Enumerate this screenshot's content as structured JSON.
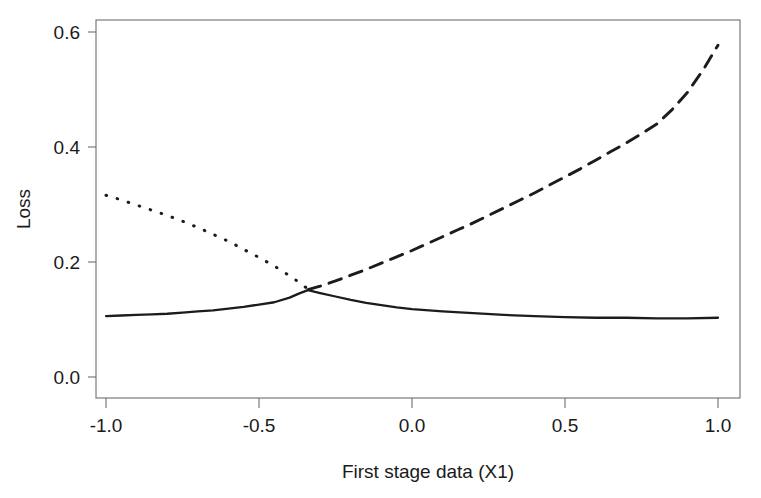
{
  "figure": {
    "clipped_title_fragment": "(        )        ",
    "background_color": "#ffffff",
    "axis_color": "#6e6e6e",
    "line_color": "#1c1c1c"
  },
  "axes": {
    "x_title": "First stage data (X1)",
    "y_title": "Loss",
    "x_ticks": [
      "-1.0",
      "-0.5",
      "0.0",
      "0.5",
      "1.0"
    ],
    "y_ticks": [
      "0.0",
      "0.2",
      "0.4",
      "0.6"
    ]
  },
  "chart_data": {
    "type": "line",
    "title": "",
    "xlabel": "First stage data (X1)",
    "ylabel": "Loss",
    "xlim": [
      -1.0,
      1.0
    ],
    "ylim": [
      0.0,
      0.64
    ],
    "xticks": [
      -1.0,
      -0.5,
      0.0,
      0.5,
      1.0
    ],
    "yticks": [
      0.0,
      0.2,
      0.4,
      0.6
    ],
    "grid": false,
    "legend": "none",
    "series": [
      {
        "name": "solid-curve",
        "style": "solid",
        "color": "#1c1c1c",
        "x": [
          -1.0,
          -0.95,
          -0.9,
          -0.85,
          -0.8,
          -0.75,
          -0.7,
          -0.65,
          -0.6,
          -0.55,
          -0.5,
          -0.45,
          -0.4,
          -0.37,
          -0.34,
          -0.3,
          -0.25,
          -0.2,
          -0.15,
          -0.1,
          -0.05,
          0.0,
          0.1,
          0.2,
          0.3,
          0.4,
          0.5,
          0.6,
          0.7,
          0.8,
          0.9,
          1.0
        ],
        "y": [
          0.106,
          0.107,
          0.108,
          0.109,
          0.11,
          0.112,
          0.114,
          0.116,
          0.119,
          0.122,
          0.126,
          0.13,
          0.138,
          0.145,
          0.151,
          0.146,
          0.14,
          0.134,
          0.129,
          0.125,
          0.121,
          0.118,
          0.114,
          0.111,
          0.108,
          0.106,
          0.104,
          0.103,
          0.103,
          0.102,
          0.102,
          0.103
        ]
      },
      {
        "name": "dotted-curve",
        "style": "dotted",
        "color": "#1c1c1c",
        "x": [
          -1.0,
          -0.95,
          -0.9,
          -0.85,
          -0.8,
          -0.75,
          -0.7,
          -0.65,
          -0.6,
          -0.55,
          -0.5,
          -0.45,
          -0.4,
          -0.37,
          -0.34
        ],
        "y": [
          0.316,
          0.308,
          0.299,
          0.29,
          0.281,
          0.271,
          0.26,
          0.248,
          0.236,
          0.222,
          0.208,
          0.193,
          0.176,
          0.165,
          0.153
        ]
      },
      {
        "name": "dashed-curve",
        "style": "dashed",
        "color": "#1c1c1c",
        "x": [
          -0.34,
          -0.3,
          -0.25,
          -0.2,
          -0.15,
          -0.1,
          -0.05,
          0.0,
          0.05,
          0.1,
          0.15,
          0.2,
          0.25,
          0.3,
          0.35,
          0.4,
          0.45,
          0.5,
          0.55,
          0.6,
          0.65,
          0.7,
          0.75,
          0.8,
          0.85,
          0.9,
          0.95,
          1.0
        ],
        "y": [
          0.152,
          0.158,
          0.167,
          0.177,
          0.187,
          0.198,
          0.209,
          0.22,
          0.232,
          0.244,
          0.256,
          0.268,
          0.281,
          0.294,
          0.307,
          0.32,
          0.334,
          0.348,
          0.362,
          0.377,
          0.392,
          0.407,
          0.423,
          0.44,
          0.465,
          0.495,
          0.533,
          0.577
        ]
      }
    ]
  }
}
